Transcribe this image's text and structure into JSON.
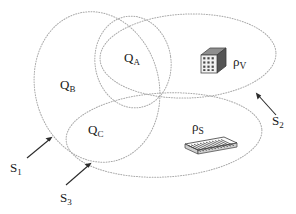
{
  "figure": {
    "type": "venn-diagram",
    "background_color": "#ffffff",
    "outline_color": "#a8a8a8",
    "label_color": "#1a1a1a",
    "arrow_color": "#2b2b2b"
  },
  "regions": [
    {
      "id": "QA",
      "base": "Q",
      "sub": "A",
      "label": "Q",
      "subscript": "A"
    },
    {
      "id": "QB",
      "base": "Q",
      "sub": "B",
      "label": "Q",
      "subscript": "B"
    },
    {
      "id": "QC",
      "base": "Q",
      "sub": "C",
      "label": "Q",
      "subscript": "C"
    }
  ],
  "sets": [
    {
      "id": "S1",
      "base": "S",
      "sub": "1",
      "label": "S",
      "subscript": "1"
    },
    {
      "id": "S2",
      "base": "S",
      "sub": "2",
      "label": "S",
      "subscript": "2"
    },
    {
      "id": "S3",
      "base": "S",
      "sub": "3",
      "label": "S",
      "subscript": "3"
    }
  ],
  "densities": [
    {
      "id": "rhoV",
      "base": "ρ",
      "sub": "V",
      "icon": "cube-icon",
      "label": "ρ",
      "subscript": "V"
    },
    {
      "id": "rhoS",
      "base": "ρ",
      "sub": "S",
      "icon": "hatched-slab-icon",
      "label": "ρ",
      "subscript": "S"
    }
  ],
  "labels": {
    "QA_base": "Q",
    "QA_sub": "A",
    "QB_base": "Q",
    "QB_sub": "B",
    "QC_base": "Q",
    "QC_sub": "C",
    "S1_base": "S",
    "S1_sub": "1",
    "S2_base": "S",
    "S2_sub": "2",
    "S3_base": "S",
    "S3_sub": "3",
    "rhoV_base": "ρ",
    "rhoV_sub": "V",
    "rhoS_base": "ρ",
    "rhoS_sub": "S"
  },
  "icons": {
    "cube": "cube-icon",
    "slab": "hatched-slab-icon",
    "arrow": "arrow-icon"
  }
}
